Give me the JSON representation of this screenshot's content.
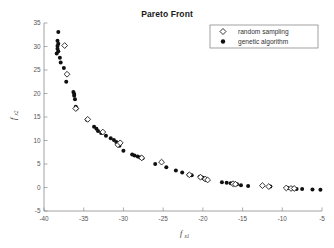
{
  "chart_data": {
    "type": "scatter",
    "title": "Pareto Front",
    "xlabel": "f",
    "xlabel_sub": "x1",
    "ylabel": "f",
    "ylabel_sub": "x2",
    "xlim": [
      -40,
      -5
    ],
    "ylim": [
      -5,
      35
    ],
    "xticks": [
      -40,
      -35,
      -30,
      -25,
      -20,
      -15,
      -10,
      -5
    ],
    "xtick_labels": [
      "-40",
      "-35",
      "-30",
      "-25",
      "-20",
      "-15",
      "-10",
      "-5"
    ],
    "yticks": [
      -5,
      0,
      5,
      10,
      15,
      20,
      25,
      30,
      35
    ],
    "ytick_labels": [
      "-5",
      "0",
      "5",
      "10",
      "15",
      "20",
      "25",
      "30",
      "35"
    ],
    "grid": false,
    "legend_position": "top-right",
    "series": [
      {
        "name": "random sampling",
        "marker": "diamond-open",
        "color": "#101010",
        "points": [
          [
            -37.4,
            30.2
          ],
          [
            -37.1,
            24.1
          ],
          [
            -36.0,
            16.8
          ],
          [
            -34.5,
            14.5
          ],
          [
            -32.6,
            11.8
          ],
          [
            -30.7,
            9.1
          ],
          [
            -30.4,
            9.5
          ],
          [
            -27.7,
            6.3
          ],
          [
            -25.2,
            5.4
          ],
          [
            -21.7,
            2.7
          ],
          [
            -20.3,
            2.2
          ],
          [
            -19.7,
            1.8
          ],
          [
            -19.4,
            1.6
          ],
          [
            -16.2,
            0.8
          ],
          [
            -15.9,
            0.7
          ],
          [
            -12.5,
            0.4
          ],
          [
            -11.7,
            0.2
          ],
          [
            -9.5,
            -0.1
          ],
          [
            -8.9,
            -0.2
          ],
          [
            -8.5,
            -0.2
          ]
        ]
      },
      {
        "name": "genetic algorithm",
        "marker": "circle-filled",
        "color": "#101010",
        "points": [
          [
            -38.2,
            33.1
          ],
          [
            -38.3,
            31.2
          ],
          [
            -38.2,
            30.6
          ],
          [
            -38.3,
            30.1
          ],
          [
            -38.3,
            29.5
          ],
          [
            -38.2,
            29.0
          ],
          [
            -38.4,
            28.5
          ],
          [
            -38.0,
            27.6
          ],
          [
            -37.9,
            26.6
          ],
          [
            -37.5,
            25.4
          ],
          [
            -37.2,
            22.5
          ],
          [
            -36.3,
            20.3
          ],
          [
            -36.2,
            19.9
          ],
          [
            -36.2,
            19.5
          ],
          [
            -36.1,
            18.8
          ],
          [
            -36.0,
            17.2
          ],
          [
            -35.9,
            16.8
          ],
          [
            -34.6,
            14.4
          ],
          [
            -33.7,
            12.9
          ],
          [
            -33.4,
            12.5
          ],
          [
            -33.2,
            12.0
          ],
          [
            -32.8,
            11.6
          ],
          [
            -32.2,
            11.0
          ],
          [
            -31.6,
            10.5
          ],
          [
            -31.2,
            10.1
          ],
          [
            -30.9,
            9.7
          ],
          [
            -30.7,
            9.3
          ],
          [
            -30.5,
            8.9
          ],
          [
            -30.0,
            7.8
          ],
          [
            -28.9,
            7.0
          ],
          [
            -28.6,
            6.8
          ],
          [
            -28.2,
            6.6
          ],
          [
            -27.9,
            6.4
          ],
          [
            -27.6,
            6.2
          ],
          [
            -26.0,
            5.0
          ],
          [
            -24.6,
            4.3
          ],
          [
            -23.4,
            3.6
          ],
          [
            -22.6,
            3.2
          ],
          [
            -21.8,
            2.7
          ],
          [
            -21.4,
            2.6
          ],
          [
            -20.4,
            2.3
          ],
          [
            -20.2,
            2.2
          ],
          [
            -20.0,
            2.1
          ],
          [
            -19.8,
            1.8
          ],
          [
            -19.5,
            1.6
          ],
          [
            -17.6,
            1.1
          ],
          [
            -17.0,
            1.0
          ],
          [
            -16.5,
            0.9
          ],
          [
            -16.1,
            0.8
          ],
          [
            -15.7,
            0.7
          ],
          [
            -15.2,
            0.5
          ],
          [
            -14.3,
            0.3
          ],
          [
            -11.5,
            0.2
          ],
          [
            -9.3,
            -0.1
          ],
          [
            -8.6,
            -0.2
          ],
          [
            -8.2,
            -0.3
          ],
          [
            -7.5,
            -0.3
          ],
          [
            -6.2,
            -0.4
          ],
          [
            -5.2,
            -0.5
          ]
        ]
      }
    ]
  }
}
